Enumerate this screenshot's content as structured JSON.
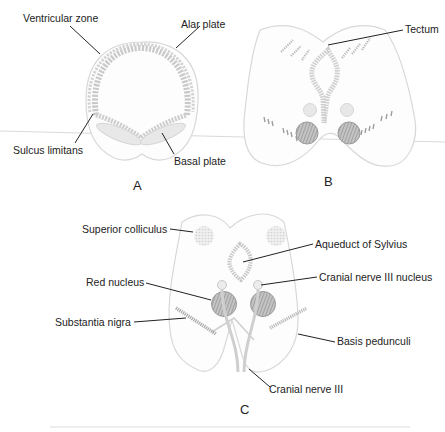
{
  "figure": {
    "panels": [
      {
        "id": "A",
        "label": "A",
        "annotations": [
          "Ventricular zone",
          "Alar plate",
          "Sulcus limitans",
          "Basal plate"
        ]
      },
      {
        "id": "B",
        "label": "B",
        "annotations": [
          "Tectum"
        ]
      },
      {
        "id": "C",
        "label": "C",
        "annotations": [
          "Superior colliculus",
          "Aqueduct of Sylvius",
          "Red nucleus",
          "Cranial nerve III nucleus",
          "Substantia nigra",
          "Basis pedunculi",
          "Cranial nerve III"
        ]
      }
    ],
    "colors": {
      "text": "#222222",
      "tissue_outline": "#d8d8d8",
      "structure_fill": "#e8e8e8",
      "hatched_nucleus": "#9a9a9a",
      "background": "#ffffff"
    }
  }
}
